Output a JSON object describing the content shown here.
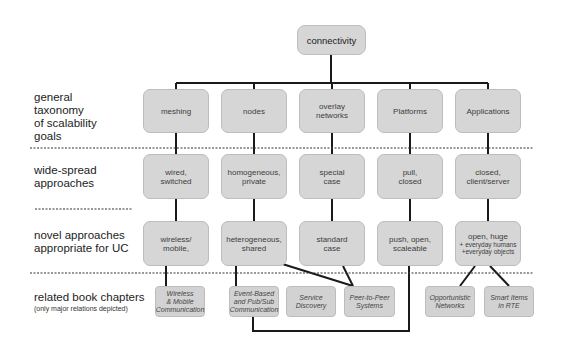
{
  "diagram": {
    "root": {
      "label": "connectivity"
    },
    "row_labels": {
      "goals": "general taxonomy of scalability goals",
      "goals_lines": [
        "general",
        "taxonomy",
        "of scalability",
        "goals"
      ],
      "widespread_lines": [
        "wide-spread",
        "approaches"
      ],
      "novel_lines": [
        "novel approaches",
        "appropriate for UC"
      ],
      "chapters_title": "related book chapters",
      "chapters_note": "(only major relations depicted)"
    },
    "columns": [
      {
        "goal": [
          "meshing"
        ],
        "widespread": [
          "wired,",
          "switched"
        ],
        "novel": [
          "wireless/",
          "mobile,"
        ]
      },
      {
        "goal": [
          "nodes"
        ],
        "widespread": [
          "homogeneous,",
          "private"
        ],
        "novel": [
          "heterogeneous,",
          "shared"
        ]
      },
      {
        "goal": [
          "overlay",
          "networks"
        ],
        "widespread": [
          "special",
          "case"
        ],
        "novel": [
          "standard",
          "case"
        ]
      },
      {
        "goal": [
          "Platforms"
        ],
        "widespread": [
          "pull,",
          "closed"
        ],
        "novel": [
          "push, open,",
          "scaleable"
        ]
      },
      {
        "goal": [
          "Applications"
        ],
        "widespread": [
          "closed,",
          "client/server"
        ],
        "novel_main": "open, huge",
        "novel_sub": [
          "+ everyday humans",
          "+everyday objects"
        ]
      }
    ],
    "chapters": [
      {
        "lines": [
          "Wireless",
          "& Mobile",
          "Communication"
        ]
      },
      {
        "lines": [
          "Event-Based",
          "and Pub/Sub",
          "Communication"
        ]
      },
      {
        "lines": [
          "Service",
          "Discovery"
        ]
      },
      {
        "lines": [
          "Peer-to-Peer",
          "Systems"
        ]
      },
      {
        "lines": [
          "Opportunistic",
          "Networks"
        ]
      },
      {
        "lines": [
          "Smart Items",
          "in RTE"
        ]
      }
    ],
    "colors": {
      "box_fill": "#d6d6d6",
      "line": "#1a1a1a",
      "text": "#3d3d3d"
    }
  }
}
